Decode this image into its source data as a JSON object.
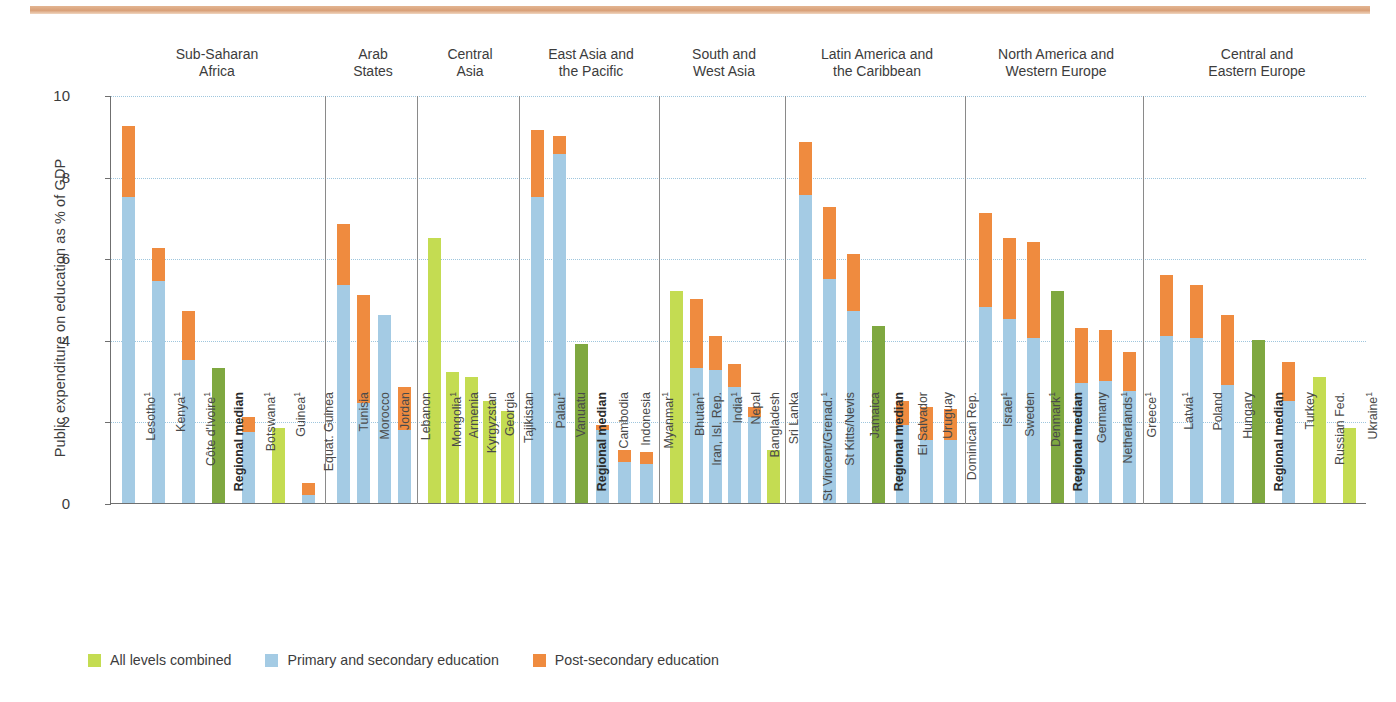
{
  "chart_data": {
    "type": "bar",
    "title": "",
    "xlabel": "",
    "ylabel": "Public expenditure on education as % of GDP",
    "ylim": [
      0,
      10
    ],
    "yticks": [
      0,
      2,
      4,
      6,
      8,
      10
    ],
    "grid": true,
    "stacked": true,
    "legend_position": "bottom-left",
    "series": [
      {
        "name": "All levels combined",
        "color": "#c4dc52"
      },
      {
        "name": "Primary and secondary education",
        "color": "#a4cbe4"
      },
      {
        "name": "Post-secondary education",
        "color": "#ef8b3f"
      }
    ],
    "groups": [
      {
        "name": "Sub-Saharan\nAfrica",
        "line1": "Sub-Saharan",
        "line2": "Africa",
        "bars": [
          {
            "label": "Lesotho",
            "sup": "1",
            "bold": false,
            "all": 0,
            "primary": 7.5,
            "post": 1.75,
            "total": 9.25
          },
          {
            "label": "Kenya",
            "sup": "1",
            "bold": false,
            "all": 0,
            "primary": 5.45,
            "post": 0.8,
            "total": 6.25
          },
          {
            "label": "Côte d'Ivoire",
            "sup": "1",
            "bold": false,
            "all": 0,
            "primary": 3.5,
            "post": 1.2,
            "total": 4.7
          },
          {
            "label": "Regional median",
            "sup": "",
            "bold": true,
            "median": 3.3,
            "total": 3.3
          },
          {
            "label": "Botswana",
            "sup": "1",
            "bold": false,
            "all": 0,
            "primary": 1.75,
            "post": 0.35,
            "total": 2.1
          },
          {
            "label": "Guinea",
            "sup": "1",
            "bold": false,
            "all": 1.85,
            "primary": 0,
            "post": 0,
            "total": 1.85
          },
          {
            "label": "Equat. Guinea",
            "sup": "",
            "bold": false,
            "all": 0,
            "primary": 0.2,
            "post": 0.3,
            "total": 0.5
          }
        ]
      },
      {
        "name": "Arab\nStates",
        "line1": "Arab",
        "line2": "States",
        "bars": [
          {
            "label": "Tunisia",
            "sup": "",
            "bold": false,
            "all": 0,
            "primary": 5.35,
            "post": 1.5,
            "total": 6.85
          },
          {
            "label": "Morocco",
            "sup": "",
            "bold": false,
            "all": 0,
            "primary": 2.45,
            "post": 2.65,
            "total": 5.1
          },
          {
            "label": "Jordan",
            "sup": "",
            "bold": false,
            "all": 0,
            "primary": 4.6,
            "post": 0,
            "total": 4.6
          },
          {
            "label": "Lebanon",
            "sup": "",
            "bold": false,
            "all": 0,
            "primary": 1.8,
            "post": 1.05,
            "total": 2.85
          }
        ]
      },
      {
        "name": "Central\nAsia",
        "line1": "Central",
        "line2": "Asia",
        "bars": [
          {
            "label": "Mongolia",
            "sup": "1",
            "bold": false,
            "all": 6.5,
            "primary": 0,
            "post": 0,
            "total": 6.5
          },
          {
            "label": "Armenia",
            "sup": "",
            "bold": false,
            "all": 3.2,
            "primary": 0,
            "post": 0,
            "total": 3.2
          },
          {
            "label": "Kyrgyzstan",
            "sup": "",
            "bold": false,
            "all": 3.1,
            "primary": 0,
            "post": 0,
            "total": 3.1
          },
          {
            "label": "Georgia",
            "sup": "",
            "bold": false,
            "all": 2.5,
            "primary": 0,
            "post": 0,
            "total": 2.5
          },
          {
            "label": "Tajikistan",
            "sup": "",
            "bold": false,
            "all": 2.25,
            "primary": 0,
            "post": 0,
            "total": 2.25
          }
        ]
      },
      {
        "name": "East Asia and\nthe Pacific",
        "line1": "East Asia and",
        "line2": "the Pacific",
        "bars": [
          {
            "label": "Palau",
            "sup": "1",
            "bold": false,
            "all": 0,
            "primary": 7.5,
            "post": 1.65,
            "total": 9.15
          },
          {
            "label": "Vanuatu",
            "sup": "",
            "bold": false,
            "all": 0,
            "primary": 8.55,
            "post": 0.45,
            "total": 9.0
          },
          {
            "label": "Regional median",
            "sup": "",
            "bold": true,
            "median": 3.9,
            "total": 3.9
          },
          {
            "label": "Cambodia",
            "sup": "",
            "bold": false,
            "all": 0,
            "primary": 1.8,
            "post": 0.1,
            "total": 1.9
          },
          {
            "label": "Indonesia",
            "sup": "",
            "bold": false,
            "all": 0,
            "primary": 1.0,
            "post": 0.3,
            "total": 1.3
          },
          {
            "label": "Myanmar",
            "sup": "1",
            "bold": false,
            "all": 0,
            "primary": 0.95,
            "post": 0.3,
            "total": 1.25
          }
        ]
      },
      {
        "name": "South and\nWest Asia",
        "line1": "South and",
        "line2": "West Asia",
        "bars": [
          {
            "label": "Bhutan",
            "sup": "1",
            "bold": false,
            "all": 5.2,
            "primary": 0,
            "post": 0,
            "total": 5.2
          },
          {
            "label": "Iran, Isl. Rep.",
            "sup": "",
            "bold": false,
            "all": 0,
            "primary": 3.3,
            "post": 1.7,
            "total": 5.0
          },
          {
            "label": "India",
            "sup": "1",
            "bold": false,
            "all": 0,
            "primary": 3.25,
            "post": 0.85,
            "total": 4.1
          },
          {
            "label": "Nepal",
            "sup": "",
            "bold": false,
            "all": 0,
            "primary": 2.85,
            "post": 0.55,
            "total": 3.4
          },
          {
            "label": "Bangladesh",
            "sup": "",
            "bold": false,
            "all": 0,
            "primary": 2.1,
            "post": 0.25,
            "total": 2.35
          },
          {
            "label": "Sri Lanka",
            "sup": "",
            "bold": false,
            "all": 1.3,
            "primary": 0,
            "post": 0,
            "total": 1.3
          }
        ]
      },
      {
        "name": "Latin America and\nthe Caribbean",
        "line1": "Latin America and",
        "line2": "the Caribbean",
        "bars": [
          {
            "label": "St Vincent/Grenad.",
            "sup": "1",
            "bold": false,
            "all": 0,
            "primary": 7.55,
            "post": 1.3,
            "total": 8.85
          },
          {
            "label": "St Kitts/Nevis",
            "sup": "",
            "bold": false,
            "all": 0,
            "primary": 5.5,
            "post": 1.75,
            "total": 7.25
          },
          {
            "label": "Jamaica",
            "sup": "",
            "bold": false,
            "all": 0,
            "primary": 4.7,
            "post": 1.4,
            "total": 6.1
          },
          {
            "label": "Regional median",
            "sup": "",
            "bold": true,
            "median": 4.35,
            "total": 4.35
          },
          {
            "label": "El Salvador",
            "sup": "",
            "bold": false,
            "all": 0,
            "primary": 1.9,
            "post": 0.6,
            "total": 2.5
          },
          {
            "label": "Uruguay",
            "sup": "",
            "bold": false,
            "all": 0,
            "primary": 1.55,
            "post": 0.8,
            "total": 2.35
          },
          {
            "label": "Dominican Rep.",
            "sup": "",
            "bold": false,
            "all": 0,
            "primary": 1.55,
            "post": 0.75,
            "total": 2.3
          }
        ]
      },
      {
        "name": "North America and\nWestern Europe",
        "line1": "North America and",
        "line2": "Western Europe",
        "bars": [
          {
            "label": "Israel",
            "sup": "1",
            "bold": false,
            "all": 0,
            "primary": 4.8,
            "post": 2.3,
            "total": 7.1
          },
          {
            "label": "Sweden",
            "sup": "",
            "bold": false,
            "all": 0,
            "primary": 4.5,
            "post": 2.0,
            "total": 6.5
          },
          {
            "label": "Denmark",
            "sup": "1",
            "bold": false,
            "all": 0,
            "primary": 4.05,
            "post": 2.35,
            "total": 6.4
          },
          {
            "label": "Regional median",
            "sup": "",
            "bold": true,
            "median": 5.2,
            "total": 5.2
          },
          {
            "label": "Germany",
            "sup": "",
            "bold": false,
            "all": 0,
            "primary": 2.95,
            "post": 1.35,
            "total": 4.3
          },
          {
            "label": "Netherlands",
            "sup": "1",
            "bold": false,
            "all": 0,
            "primary": 3.0,
            "post": 1.25,
            "total": 4.25
          },
          {
            "label": "Greece",
            "sup": "1",
            "bold": false,
            "all": 0,
            "primary": 2.75,
            "post": 0.95,
            "total": 3.7
          }
        ]
      },
      {
        "name": "Central and\nEastern Europe",
        "line1": "Central and",
        "line2": "Eastern Europe",
        "bars": [
          {
            "label": "Latvia",
            "sup": "1",
            "bold": false,
            "all": 0,
            "primary": 4.1,
            "post": 1.5,
            "total": 5.6
          },
          {
            "label": "Poland",
            "sup": "",
            "bold": false,
            "all": 0,
            "primary": 4.05,
            "post": 1.3,
            "total": 5.35
          },
          {
            "label": "Hungary",
            "sup": "",
            "bold": false,
            "all": 0,
            "primary": 2.9,
            "post": 1.7,
            "total": 4.6
          },
          {
            "label": "Regional median",
            "sup": "",
            "bold": true,
            "median": 4.0,
            "total": 4.0
          },
          {
            "label": "Turkey",
            "sup": "",
            "bold": false,
            "all": 0,
            "primary": 2.5,
            "post": 0.95,
            "total": 3.45
          },
          {
            "label": "Russian Fed.",
            "sup": "",
            "bold": false,
            "all": 3.1,
            "primary": 0,
            "post": 0,
            "total": 3.1
          },
          {
            "label": "Ukraine",
            "sup": "1",
            "bold": false,
            "all": 1.85,
            "primary": 0,
            "post": 0,
            "total": 1.85
          }
        ]
      }
    ]
  },
  "colors": {
    "all_levels": "#c4dc52",
    "primary_secondary": "#a4cbe4",
    "post_secondary": "#ef8b3f",
    "regional_median": "#7fa840",
    "grid": "#9fc6dd",
    "axis": "#6f6f6f",
    "banner": "#d9a078"
  }
}
